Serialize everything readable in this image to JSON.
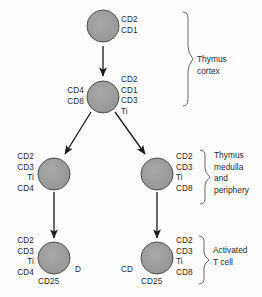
{
  "diagram": {
    "cell_color": "#9a9a9a",
    "cell_border_color": "#4a4a4a",
    "text_color": "#2a2a2a",
    "cells": [
      {
        "id": "prothymocyte",
        "name": "stem-cell",
        "cx": 103,
        "cy": 26,
        "r": 16,
        "markers_right": [
          "CD2",
          "CD1"
        ],
        "markers_left": [],
        "markers_below": []
      },
      {
        "id": "common-thymocyte",
        "name": "common-thymocyte",
        "cx": 103,
        "cy": 97,
        "r": 16,
        "markers_right": [
          "CD2",
          "CD1",
          "CD3",
          "Ti"
        ],
        "markers_left": [
          "CD4",
          "CD8"
        ],
        "markers_below": []
      },
      {
        "id": "cd4-thymocyte",
        "name": "cd4-mature-thymocyte",
        "cx": 54,
        "cy": 174,
        "r": 16,
        "markers_right": [],
        "markers_left": [
          "CD2",
          "CD3",
          "Ti",
          "CD4"
        ],
        "markers_below": []
      },
      {
        "id": "cd8-thymocyte",
        "name": "cd8-mature-thymocyte",
        "cx": 157,
        "cy": 174,
        "r": 16,
        "markers_right": [
          "CD2",
          "CD3",
          "Ti",
          "CD8"
        ],
        "markers_left": [],
        "markers_below": []
      },
      {
        "id": "cd4-activated",
        "name": "cd4-activated-t-cell",
        "cx": 54,
        "cy": 258,
        "r": 16,
        "markers_right": [
          "D"
        ],
        "markers_left": [
          "CD2",
          "CD3",
          "Ti",
          "CD4"
        ],
        "markers_below": [
          "CD25"
        ]
      },
      {
        "id": "cd8-activated",
        "name": "cd8-activated-t-cell",
        "cx": 157,
        "cy": 258,
        "r": 16,
        "markers_right": [
          "CD2",
          "CD3",
          "Ti",
          "CD8"
        ],
        "markers_left": [
          "CD"
        ],
        "markers_below": [
          "CD25"
        ]
      }
    ],
    "marker_labels": {
      "top_right": "CD2\nCD1",
      "second_right": "CD2\nCD1\nCD3\nTi",
      "second_left": "CD4\nCD8",
      "mid_left_left": "CD2\nCD3\nTi\nCD4",
      "mid_right_right": "CD2\nCD3\nTi\nCD8",
      "bottom_left_left": "CD2\nCD3\nTi\nCD4",
      "bottom_left_right": "D",
      "bottom_left_below": "CD25",
      "bottom_right_left": "CD",
      "bottom_right_right": "CD2\nCD3\nTi\nCD8",
      "bottom_right_below": "CD25"
    },
    "brace_groups": [
      {
        "id": "thymus-cortex",
        "label": "Thymus\ncortex",
        "label_x": 197,
        "label_y": 54,
        "brace_x": 187,
        "brace_top": 12,
        "brace_bottom": 106
      },
      {
        "id": "thymus-medulla-periphery",
        "label": "Thymus\nmedulla\nand\nperiphery",
        "label_x": 214,
        "label_y": 152,
        "brace_x": 204,
        "brace_top": 150,
        "brace_bottom": 198
      },
      {
        "id": "activated-t-cell",
        "label": "Activated\nT cell",
        "label_x": 213,
        "label_y": 246,
        "brace_x": 203,
        "brace_top": 236,
        "brace_bottom": 278
      }
    ],
    "arrows": [
      {
        "id": "arrow-stem-to-common",
        "name": "arrow-stem-to-common",
        "x1": 103,
        "y1": 46,
        "x2": 103,
        "y2": 76
      },
      {
        "id": "arrow-common-to-cd4",
        "name": "arrow-common-to-cd4",
        "x1": 90,
        "y1": 112,
        "x2": 64,
        "y2": 155
      },
      {
        "id": "arrow-common-to-cd8",
        "name": "arrow-common-to-cd8",
        "x1": 116,
        "y1": 112,
        "x2": 146,
        "y2": 155
      },
      {
        "id": "arrow-cd4-to-activated",
        "name": "arrow-cd4-to-activated",
        "x1": 54,
        "y1": 192,
        "x2": 54,
        "y2": 238
      },
      {
        "id": "arrow-cd8-to-activated",
        "name": "arrow-cd8-to-activated",
        "x1": 157,
        "y1": 192,
        "x2": 157,
        "y2": 238
      }
    ]
  }
}
